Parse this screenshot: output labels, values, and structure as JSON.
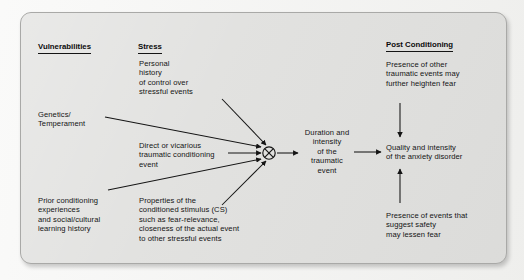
{
  "figure": {
    "panel_bg": "#e0e0de",
    "page_bg": "#f4f4f2",
    "ink": "#141414",
    "columns": [
      {
        "id": "vulnerabilities",
        "heading": "Vulnerabilities"
      },
      {
        "id": "stress",
        "heading": "Stress"
      },
      {
        "id": "post_conditioning",
        "heading": "Post Conditioning"
      }
    ],
    "nodes": {
      "genetics": "Genetics/\nTemperament",
      "prior_conditioning": "Prior conditioning\nexperiences\nand social/cultural\nlearning history",
      "personal_history": "Personal\nhistory\nof control over\nstressful events",
      "direct_vicarious": "Direct or vicarious\ntraumatic conditioning\nevent",
      "cs_properties": "Properties of the\nconditioned stimulus (CS)\nsuch as fear-relevance,\ncloseness of the actual event\nto other stressful events",
      "convergence_symbol": "circled-x",
      "duration": "Duration and\nintensity\nof the\ntraumatic\nevent",
      "outcome": "Quality and intensity\nof the anxiety disorder",
      "heighten": "Presence of other\ntraumatic events may\nfurther heighten fear",
      "lessen": "Presence of events that\nsuggest safety\nmay lessen fear"
    },
    "edges": [
      {
        "from": "genetics",
        "to": "convergence_symbol"
      },
      {
        "from": "prior_conditioning",
        "to": "convergence_symbol"
      },
      {
        "from": "personal_history",
        "to": "convergence_symbol"
      },
      {
        "from": "direct_vicarious",
        "to": "convergence_symbol"
      },
      {
        "from": "cs_properties",
        "to": "convergence_symbol"
      },
      {
        "from": "convergence_symbol",
        "to": "duration"
      },
      {
        "from": "duration",
        "to": "outcome"
      },
      {
        "from": "heighten",
        "to": "outcome"
      },
      {
        "from": "lessen",
        "to": "outcome"
      }
    ]
  }
}
